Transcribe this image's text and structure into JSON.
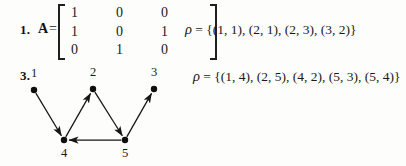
{
  "page": {
    "background_color": "#fdfdfc",
    "ink_color": "#1a1a1a"
  },
  "exercises": [
    {
      "number": "1.",
      "matrix_label": "A",
      "equals": "=",
      "matrix": {
        "rows": [
          [
            "1",
            "0",
            "0"
          ],
          [
            "1",
            "0",
            "1"
          ],
          [
            "0",
            "1",
            "0"
          ]
        ]
      },
      "relation": {
        "symbol": "ρ",
        "equals": "=",
        "set_text": "{(1, 1), (2, 1), (2, 3), (3, 2)}",
        "pairs": [
          [
            1,
            1
          ],
          [
            2,
            1
          ],
          [
            2,
            3
          ],
          [
            3,
            2
          ]
        ]
      }
    },
    {
      "number": "3.",
      "relation": {
        "symbol": "ρ",
        "equals": "=",
        "set_text": "{(1, 4), (2, 5), (4, 2), (5, 3), (5, 4)}",
        "pairs": [
          [
            1,
            4
          ],
          [
            2,
            5
          ],
          [
            4,
            2
          ],
          [
            5,
            3
          ],
          [
            5,
            4
          ]
        ]
      },
      "digraph": {
        "nodes": [
          {
            "id": "1",
            "label": "1",
            "x": 34,
            "y": 90,
            "label_x": 27,
            "label_y": 66
          },
          {
            "id": "2",
            "label": "2",
            "x": 93,
            "y": 89,
            "label_x": 86,
            "label_y": 65
          },
          {
            "id": "3",
            "label": "3",
            "x": 154,
            "y": 89,
            "label_x": 147,
            "label_y": 65
          },
          {
            "id": "4",
            "label": "4",
            "x": 64,
            "y": 140,
            "label_x": 57,
            "label_y": 146
          },
          {
            "id": "5",
            "label": "5",
            "x": 125,
            "y": 140,
            "label_x": 118,
            "label_y": 146
          }
        ],
        "edges": [
          {
            "from": "1",
            "to": "4"
          },
          {
            "from": "4",
            "to": "2"
          },
          {
            "from": "2",
            "to": "5"
          },
          {
            "from": "5",
            "to": "3"
          },
          {
            "from": "5",
            "to": "4"
          }
        ]
      }
    }
  ]
}
